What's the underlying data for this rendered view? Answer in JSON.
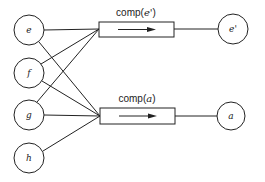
{
  "diagram": {
    "input_nodes": [
      {
        "id": "e",
        "label": "e",
        "cx": 29,
        "cy": 30
      },
      {
        "id": "f",
        "label": "f",
        "cx": 29,
        "cy": 73
      },
      {
        "id": "g",
        "label": "g",
        "cx": 29,
        "cy": 115
      },
      {
        "id": "h",
        "label": "h",
        "cx": 29,
        "cy": 158
      }
    ],
    "processors": [
      {
        "id": "comp-e-prime",
        "label_prefix": "comp(",
        "label_arg": "e'",
        "label_suffix": ")",
        "x": 99,
        "y": 22,
        "w": 75,
        "h": 15
      },
      {
        "id": "comp-a",
        "label_prefix": "comp(",
        "label_arg": "a",
        "label_suffix": ")",
        "x": 100,
        "y": 108,
        "w": 75,
        "h": 16
      }
    ],
    "output_nodes": [
      {
        "id": "e-prime",
        "label": "e'",
        "cx": 233,
        "cy": 29
      },
      {
        "id": "a",
        "label": "a",
        "cx": 231,
        "cy": 116
      }
    ],
    "edges": [
      {
        "from": "e",
        "to": "comp-e-prime"
      },
      {
        "from": "f",
        "to": "comp-e-prime"
      },
      {
        "from": "g",
        "to": "comp-e-prime"
      },
      {
        "from": "e",
        "to": "comp-a"
      },
      {
        "from": "f",
        "to": "comp-a"
      },
      {
        "from": "g",
        "to": "comp-a"
      },
      {
        "from": "h",
        "to": "comp-a"
      },
      {
        "from": "comp-e-prime",
        "to": "e-prime"
      },
      {
        "from": "comp-a",
        "to": "a"
      }
    ]
  }
}
